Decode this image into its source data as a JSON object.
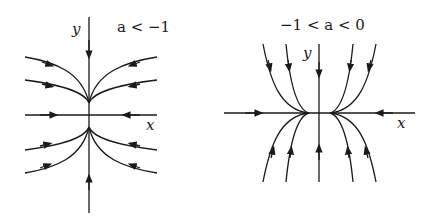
{
  "panels": [
    {
      "id": "left",
      "condition": "a < −1",
      "x_label": "x",
      "y_label": "y",
      "description": "Phase portrait: trajectories flow toward origin, curving tangent to the y-axis"
    },
    {
      "id": "right",
      "condition": "−1 < a < 0",
      "x_label": "x",
      "y_label": "y",
      "description": "Phase portrait: trajectories flow toward origin, becoming tangent to the x-axis"
    }
  ],
  "colors": {
    "stroke": "#1a1a1a",
    "background": "#ffffff"
  }
}
